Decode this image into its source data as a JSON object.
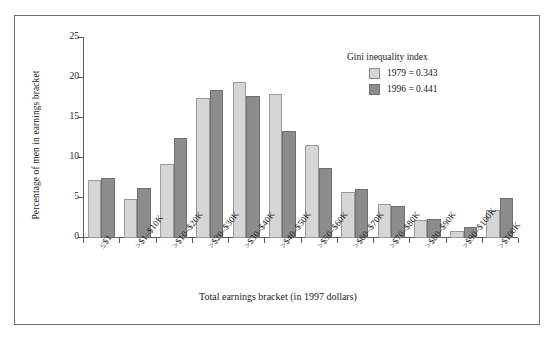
{
  "figure": {
    "frame_border_color": "#6f6f6f",
    "background": "#ffffff"
  },
  "axes": {
    "ylabel": "Percentage of men in earnings bracket",
    "xlabel": "Total earnings bracket (in 1997 dollars)",
    "yticks": [
      "0",
      "5",
      "10",
      "15",
      "20",
      "25"
    ]
  },
  "legend": {
    "title": "Gini inequality index",
    "entries": [
      {
        "label": "1979 = 0.343",
        "color": "#d6d6d6",
        "swatch": "light"
      },
      {
        "label": "1996 = 0.441",
        "color": "#8c8c8c",
        "swatch": "dark"
      }
    ]
  },
  "chart_data": {
    "type": "bar",
    "title": "",
    "xlabel": "Total earnings bracket (in 1997 dollars)",
    "ylabel": "Percentage of men in earnings bracket",
    "ylim": [
      0,
      25
    ],
    "ytick_values": [
      0,
      5,
      10,
      15,
      20,
      25
    ],
    "grid": false,
    "legend_position": "upper right",
    "categories": [
      "≤$1",
      ">$1–$10K",
      ">$10–$20K",
      ">$20–$30K",
      ">$30–$40K",
      ">$40–$50K",
      ">$50–$60K",
      ">$60–$70K",
      ">$70–$80K",
      ">$80–$90K",
      ">$90–$100K",
      ">$100K"
    ],
    "series": [
      {
        "name": "1979 = 0.343",
        "color": "#d6d6d6",
        "values": [
          7.2,
          4.9,
          9.2,
          17.5,
          19.5,
          18.0,
          11.6,
          5.8,
          4.3,
          2.3,
          0.9,
          3.5
        ]
      },
      {
        "name": "1996 = 0.441",
        "color": "#8c8c8c",
        "values": [
          7.5,
          6.3,
          12.5,
          18.5,
          17.8,
          13.4,
          8.8,
          6.1,
          4.0,
          2.4,
          1.4,
          5.0
        ]
      }
    ]
  }
}
